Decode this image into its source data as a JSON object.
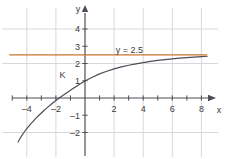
{
  "chart_data": {
    "type": "line",
    "title": "",
    "xlabel": "x",
    "ylabel": "y",
    "xlim": [
      -5.2,
      8.6
    ],
    "ylim": [
      -2.6,
      4.6
    ],
    "grid": true,
    "grid_spacing": 2,
    "legend": "none",
    "series": [
      {
        "name": "K",
        "kind": "logarithmic-curve",
        "color": "#4d4d57",
        "label": "K",
        "label_x": -1.55,
        "label_y": 1.38,
        "points": [
          {
            "x": -4.6,
            "y": -2.55
          },
          {
            "x": -4.4,
            "y": -2.25
          },
          {
            "x": -4.2,
            "y": -2.0
          },
          {
            "x": -4.0,
            "y": -1.78
          },
          {
            "x": -3.8,
            "y": -1.57
          },
          {
            "x": -3.6,
            "y": -1.38
          },
          {
            "x": -3.4,
            "y": -1.2
          },
          {
            "x": -3.2,
            "y": -1.03
          },
          {
            "x": -3.0,
            "y": -0.87
          },
          {
            "x": -2.8,
            "y": -0.71
          },
          {
            "x": -2.6,
            "y": -0.56
          },
          {
            "x": -2.4,
            "y": -0.42
          },
          {
            "x": -2.2,
            "y": -0.28
          },
          {
            "x": -2.0,
            "y": -0.15
          },
          {
            "x": -1.8,
            "y": -0.02
          },
          {
            "x": -1.6,
            "y": 0.1
          },
          {
            "x": -1.4,
            "y": 0.22
          },
          {
            "x": -1.2,
            "y": 0.34
          },
          {
            "x": -1.0,
            "y": 0.45
          },
          {
            "x": -0.8,
            "y": 0.56
          },
          {
            "x": -0.6,
            "y": 0.67
          },
          {
            "x": -0.4,
            "y": 0.78
          },
          {
            "x": -0.2,
            "y": 0.88
          },
          {
            "x": 0.0,
            "y": 0.98
          },
          {
            "x": 0.5,
            "y": 1.2
          },
          {
            "x": 1.0,
            "y": 1.4
          },
          {
            "x": 1.5,
            "y": 1.55
          },
          {
            "x": 2.0,
            "y": 1.69
          },
          {
            "x": 2.5,
            "y": 1.8
          },
          {
            "x": 3.0,
            "y": 1.9
          },
          {
            "x": 3.5,
            "y": 1.98
          },
          {
            "x": 4.0,
            "y": 2.05
          },
          {
            "x": 4.5,
            "y": 2.12
          },
          {
            "x": 5.0,
            "y": 2.18
          },
          {
            "x": 5.5,
            "y": 2.23
          },
          {
            "x": 6.0,
            "y": 2.27
          },
          {
            "x": 6.5,
            "y": 2.31
          },
          {
            "x": 7.0,
            "y": 2.34
          },
          {
            "x": 7.5,
            "y": 2.37
          },
          {
            "x": 8.0,
            "y": 2.4
          },
          {
            "x": 8.4,
            "y": 2.42
          }
        ],
        "x_intercept": -1.77,
        "y_intercept": 0.98,
        "asymptote_y": 2.5
      },
      {
        "name": "y = 2.5",
        "kind": "horizontal-line",
        "color": "#c8762a",
        "label": "y = 2.5",
        "y_value": 2.5,
        "x_start": -5.2,
        "x_end": 8.4,
        "label_x": 3.05,
        "label_y": 2.82
      }
    ],
    "x_ticks": [
      {
        "value": -4,
        "label": "–4"
      },
      {
        "value": -2,
        "label": "–2"
      },
      {
        "value": 2,
        "label": "2"
      },
      {
        "value": 4,
        "label": "4"
      },
      {
        "value": 6,
        "label": "6"
      },
      {
        "value": 8,
        "label": "8"
      }
    ],
    "x_minor_ticks": [
      -5,
      -4,
      -3,
      -2,
      -1,
      1,
      2,
      3,
      4,
      5,
      6,
      7,
      8
    ],
    "y_ticks": [
      {
        "value": 4,
        "label": "4"
      },
      {
        "value": 3,
        "label": "3"
      },
      {
        "value": 2,
        "label": "2"
      },
      {
        "value": 1,
        "label": "1"
      },
      {
        "value": -1,
        "label": "–1"
      },
      {
        "value": -2,
        "label": "–2"
      }
    ],
    "y_minor_ticks": [
      -2,
      -1,
      1,
      2,
      3,
      4
    ],
    "x_gridlines": [
      -4,
      -2,
      2,
      4,
      6,
      8
    ],
    "y_gridlines": [
      -2,
      2,
      4
    ],
    "axis_color": "#4d4d57",
    "grid_color": "#d8d8dc"
  },
  "labels": {
    "x_axis": "x",
    "y_axis": "y",
    "curve": "K",
    "line_equation": "y = 2.5"
  }
}
